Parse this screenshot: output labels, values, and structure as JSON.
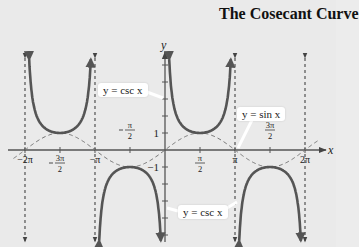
{
  "title": "The Cosecant Curve",
  "axes": {
    "x_label": "x",
    "y_label": "y"
  },
  "x_ticks": [
    {
      "label": "−2π",
      "num": "",
      "den": "",
      "neg": false,
      "value": -6.2832,
      "pos": "below"
    },
    {
      "label": "",
      "num": "3π",
      "den": "2",
      "neg": true,
      "value": -4.7124,
      "pos": "below"
    },
    {
      "label": "−π",
      "num": "",
      "den": "",
      "neg": false,
      "value": -3.1416,
      "pos": "below"
    },
    {
      "label": "",
      "num": "π",
      "den": "2",
      "neg": true,
      "value": -1.5708,
      "pos": "above"
    },
    {
      "label": "",
      "num": "π",
      "den": "2",
      "neg": false,
      "value": 1.5708,
      "pos": "below"
    },
    {
      "label": "π",
      "num": "",
      "den": "",
      "neg": false,
      "value": 3.1416,
      "pos": "below"
    },
    {
      "label": "",
      "num": "3π",
      "den": "2",
      "neg": false,
      "value": 4.7124,
      "pos": "above"
    },
    {
      "label": "2π",
      "num": "",
      "den": "",
      "neg": false,
      "value": 6.2832,
      "pos": "below"
    }
  ],
  "y_ticks": [
    {
      "label": "1",
      "value": 1
    },
    {
      "label": "−1",
      "value": -1
    }
  ],
  "callouts": {
    "csc_top": "y = csc x",
    "sin": "y = sin x",
    "csc_bottom": "y = csc x"
  },
  "colors": {
    "background": "#eaeaea",
    "csc_curve": "#555555",
    "sin_curve": "#777777",
    "axis": "#555555",
    "asymptote": "#333333"
  },
  "chart_data": {
    "type": "line",
    "title": "The Cosecant Curve",
    "xlabel": "x",
    "ylabel": "y",
    "xlim": [
      -6.9,
      7.0
    ],
    "ylim": [
      -5.4,
      6.0
    ],
    "grid": false,
    "legend": "callouts",
    "asymptotes_x": [
      -6.2832,
      -3.1416,
      0,
      3.1416,
      6.2832
    ],
    "x_tick_labels": [
      "−2π",
      "−3π/2",
      "−π",
      "−π/2",
      "π/2",
      "π",
      "3π/2",
      "2π"
    ],
    "y_tick_labels": [
      "1",
      "−1"
    ],
    "series": [
      {
        "name": "y = csc x",
        "style": "solid-thick",
        "x": [
          -6.0,
          -5.5,
          -5.0,
          -4.7124,
          -4.4,
          -3.9,
          -3.4,
          0.28,
          0.8,
          1.3,
          1.5708,
          1.9,
          2.4,
          2.86,
          3.42,
          3.9,
          4.4,
          4.7124,
          5.0,
          5.5,
          6.0
        ],
        "y": [
          3.58,
          1.42,
          1.04,
          1.0,
          1.05,
          1.46,
          3.93,
          3.62,
          1.39,
          1.04,
          1.0,
          1.06,
          1.48,
          3.6,
          -3.62,
          -1.46,
          -1.05,
          -1.0,
          -1.04,
          -1.42,
          -3.58
        ],
        "note": "Branches: U-shaped above on (−2π,−π) and (0,π) with min y=1; inverted-U below on (−π,0) and (π,2π) with max y=−1"
      },
      {
        "name": "y = sin x",
        "style": "dashed",
        "x": [
          -6.2832,
          -4.7124,
          -3.1416,
          -1.5708,
          0,
          1.5708,
          3.1416,
          4.7124,
          6.2832
        ],
        "y": [
          0,
          1,
          0,
          -1,
          0,
          1,
          0,
          -1,
          0
        ]
      }
    ]
  }
}
